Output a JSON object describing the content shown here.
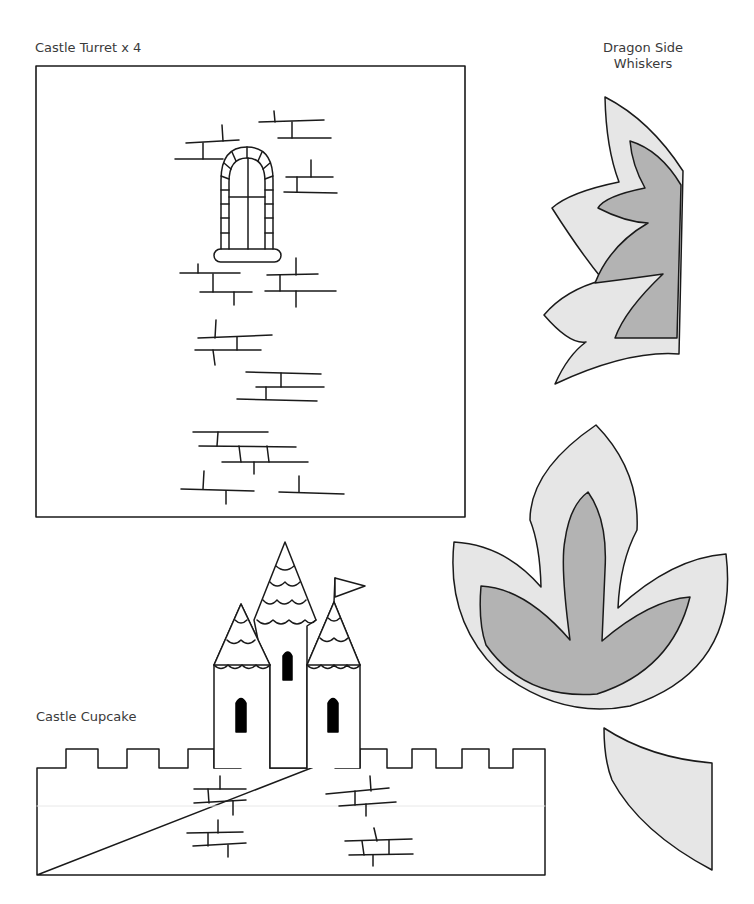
{
  "templates": {
    "castle_turret": {
      "label": "Castle Turret x 4"
    },
    "dragon_side_whiskers": {
      "label_line1": "Dragon Side",
      "label_line2": "Whiskers"
    },
    "dragon_tail": {
      "label": "Dragon Tail"
    },
    "castle_cupcake": {
      "label": "Castle Cupcake"
    },
    "dragon_spikes": {
      "label_line1": "Dragon",
      "label_line2": "Spikes"
    }
  },
  "colors": {
    "outline": "#1a1a1a",
    "light_fill": "#e6e6e6",
    "dark_fill": "#b3b3b3",
    "window_fill": "#000000",
    "paper": "#ffffff"
  }
}
